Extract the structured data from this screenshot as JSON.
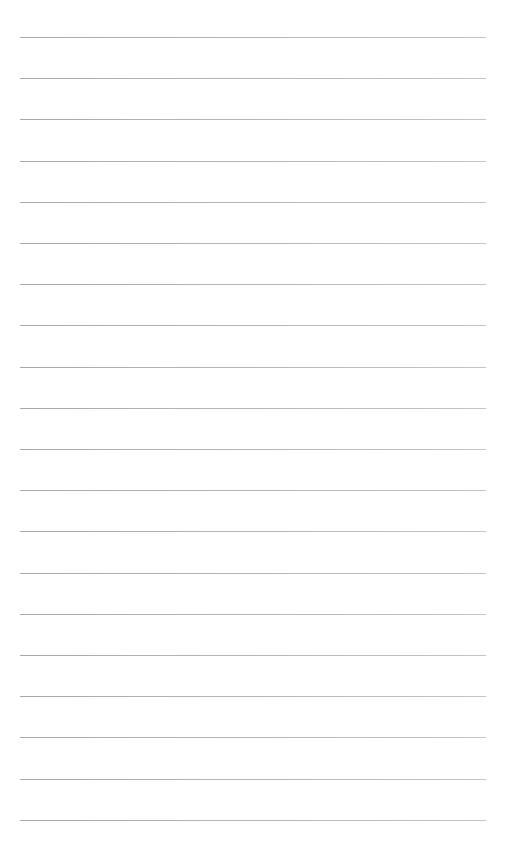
{
  "page": {
    "type": "lined-paper",
    "background": "#ffffff",
    "line_color": "#b4b4b4",
    "line_count": 20,
    "line_left": 20,
    "line_right": 486,
    "first_line_y": 37,
    "line_spacing": 41.2
  }
}
